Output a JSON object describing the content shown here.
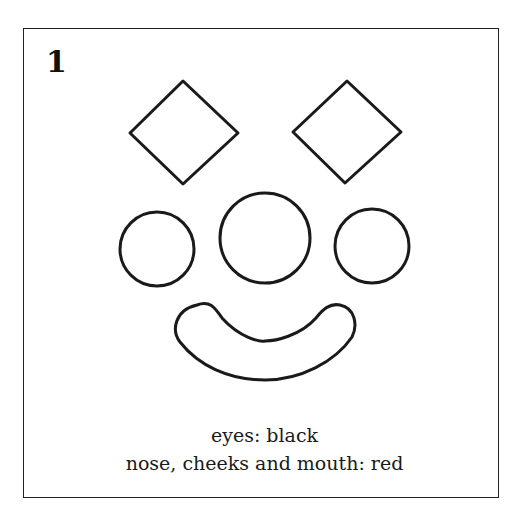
{
  "figure": {
    "number": "1",
    "caption_lines": [
      "eyes: black",
      "nose, cheeks and mouth: red"
    ]
  },
  "shapes": {
    "eyes": {
      "shape": "diamond",
      "count": 2,
      "color_label": "black"
    },
    "nose": {
      "shape": "circle",
      "count": 1,
      "color_label": "red"
    },
    "cheeks": {
      "shape": "circle",
      "count": 2,
      "color_label": "red"
    },
    "mouth": {
      "shape": "crescent",
      "count": 1,
      "color_label": "red"
    }
  },
  "colors": {
    "stroke": "#1a1a1a",
    "background": "#ffffff"
  }
}
